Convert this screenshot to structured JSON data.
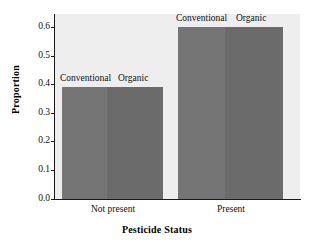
{
  "chart_data": {
    "type": "bar",
    "title": "",
    "xlabel": "Pesticide Status",
    "ylabel": "Proportion",
    "categories": [
      "Not present",
      "Present"
    ],
    "series": [
      {
        "name": "Conventional",
        "values": [
          0.39,
          0.6
        ],
        "color": "#757575"
      },
      {
        "name": "Organic",
        "values": [
          0.39,
          0.6
        ],
        "color": "#6b6b6b"
      }
    ],
    "ylim": [
      0.0,
      0.6
    ],
    "yticks": [
      "0.0",
      "0.1",
      "0.2",
      "0.3",
      "0.4",
      "0.5",
      "0.6"
    ],
    "grid": false,
    "legend_position": "above-bars",
    "plot_background": "#eeeeee",
    "axis_color": "#1a1a1a"
  },
  "axes": {
    "y_title": "Proportion",
    "x_title": "Pesticide Status",
    "y_ticks": {
      "t0": "0.0",
      "t1": "0.1",
      "t2": "0.2",
      "t3": "0.3",
      "t4": "0.4",
      "t5": "0.5",
      "t6": "0.6"
    },
    "x_categories": {
      "c0": "Not present",
      "c1": "Present"
    }
  },
  "bar_labels": {
    "group0_conventional": "Conventional",
    "group0_organic": "Organic",
    "group1_conventional": "Conventional",
    "group1_organic": "Organic"
  }
}
